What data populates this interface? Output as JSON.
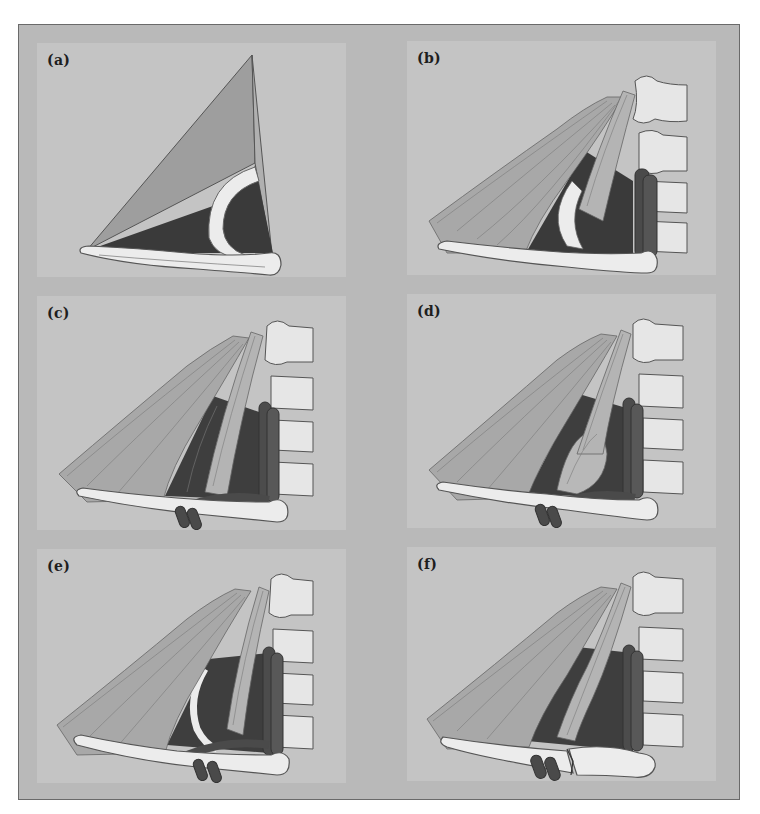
{
  "figure": {
    "panels": [
      {
        "id": "a",
        "label": "(a)",
        "content": "triangle with clavicle and first rib"
      },
      {
        "id": "b",
        "label": "(b)",
        "content": "scalene muscles, vessels, cervical spine"
      },
      {
        "id": "c",
        "label": "(c)",
        "content": "scalene muscles with neurovascular bundle"
      },
      {
        "id": "d",
        "label": "(d)",
        "content": "hypertrophied scalene muscle"
      },
      {
        "id": "e",
        "label": "(e)",
        "content": "fibrous bands and cervical rib"
      },
      {
        "id": "f",
        "label": "(f)",
        "content": "clavicle fracture"
      }
    ]
  },
  "colors": {
    "frame_bg": "#b9b9b9",
    "panel_bg": "#c4c4c4",
    "dark_space": "#3c3c3c",
    "bone": "#ececec",
    "muscle": "#a9a9a9",
    "vessel": "#4a4a4a",
    "outline": "#5a5a5a"
  }
}
